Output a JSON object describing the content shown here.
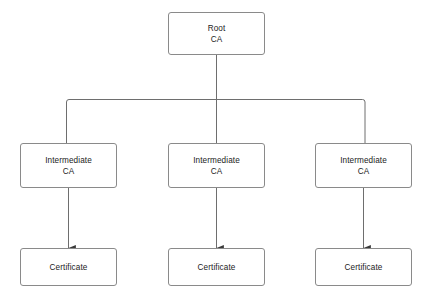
{
  "diagram": {
    "type": "tree",
    "background_color": "#ffffff",
    "stroke_color": "#8a8a8a",
    "text_color": "#1b1b1b",
    "nodes": {
      "root": {
        "line1": "Root",
        "line2": "CA"
      },
      "intermediates": [
        {
          "line1": "Intermediate",
          "line2": "CA"
        },
        {
          "line1": "Intermediate",
          "line2": "CA"
        },
        {
          "line1": "Intermediate",
          "line2": "CA"
        }
      ],
      "certificates": [
        {
          "line1": "Certificate"
        },
        {
          "line1": "Certificate"
        },
        {
          "line1": "Certificate"
        }
      ]
    },
    "edges": {
      "root_to_bus_label": "Root CA to distribution bus",
      "bus_to_intermediate_label": "distribution bus to Intermediate CA",
      "intermediate_to_certificate_label": "Intermediate CA to Certificate"
    }
  }
}
